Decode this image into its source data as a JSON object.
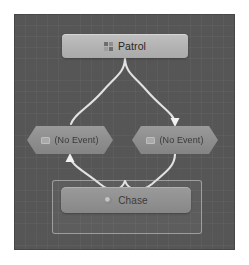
{
  "editor": {
    "name": "state-machine-graph",
    "canvas_background": "#565656",
    "grid": "on"
  },
  "nodes": [
    {
      "id": "patrol",
      "label": "Patrol",
      "type": "state",
      "shape": "rounded-rect",
      "icon": "grid-icon",
      "color": "#b2b2b2",
      "selected": false
    },
    {
      "id": "event-left",
      "label": "(No Event)",
      "type": "transition-event",
      "shape": "hexagon",
      "icon": "event-icon",
      "color": "#8d8d8d",
      "selected": false
    },
    {
      "id": "event-right",
      "label": "(No Event)",
      "type": "transition-event",
      "shape": "hexagon",
      "icon": "event-icon",
      "color": "#8d8d8d",
      "selected": false
    },
    {
      "id": "chase",
      "label": "Chase",
      "type": "state",
      "shape": "rounded-rect",
      "icon": "sphere-icon",
      "color": "#909090",
      "selected": true
    }
  ],
  "edges": [
    {
      "id": "patrol-to-event-right",
      "from": "patrol",
      "to": "event-right",
      "arrow": "down",
      "color": "#e0e0e0"
    },
    {
      "id": "event-left-from-chase",
      "from": "chase",
      "to": "event-left",
      "arrow": "up",
      "color": "#e0e0e0"
    },
    {
      "id": "event-left-to-patrol",
      "from": "event-left",
      "to": "patrol",
      "arrow": "none",
      "color": "#e0e0e0"
    },
    {
      "id": "event-right-to-chase",
      "from": "event-right",
      "to": "chase",
      "arrow": "none",
      "color": "#e0e0e0"
    }
  ],
  "colors": {
    "canvas": "#565656",
    "edge": "#e0e0e0",
    "state_node": "#b2b2b2",
    "event_node": "#8d8d8d",
    "selection_frame": "#d2d2d2"
  }
}
